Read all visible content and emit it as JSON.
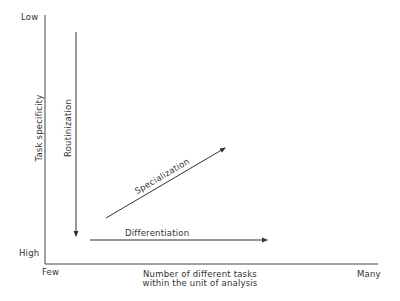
{
  "diagram": {
    "y_axis": {
      "title": "Task specificity",
      "top_label": "Low",
      "bottom_label": "High"
    },
    "x_axis": {
      "title_line1": "Number of different tasks",
      "title_line2": "within the unit of analysis",
      "left_label": "Few",
      "right_label": "Many"
    },
    "arrows": [
      {
        "label": "Routinization",
        "direction": "down"
      },
      {
        "label": "Specialization",
        "direction": "up-right"
      },
      {
        "label": "Differentiation",
        "direction": "right"
      }
    ],
    "colors": {
      "line": "#333333",
      "background": "#ffffff"
    }
  }
}
